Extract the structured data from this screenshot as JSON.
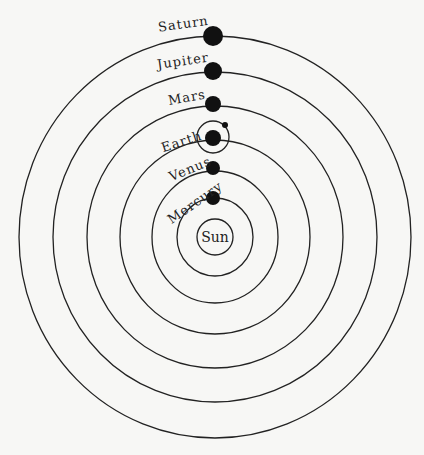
{
  "diagram": {
    "type": "heliocentric-model",
    "center": {
      "x": 215,
      "y": 237
    },
    "sun": {
      "label": "Sun",
      "r": 18
    },
    "orbits": [
      {
        "name": "Mercury",
        "rx": 38,
        "ry": 39
      },
      {
        "name": "Venus",
        "rx": 63,
        "ry": 66
      },
      {
        "name": "Earth",
        "rx": 95,
        "ry": 97
      },
      {
        "name": "Mars",
        "rx": 128,
        "ry": 131
      },
      {
        "name": "Jupiter",
        "rx": 162,
        "ry": 165
      },
      {
        "name": "Saturn",
        "rx": 196,
        "ry": 201
      }
    ],
    "planets": [
      {
        "label": "Saturn",
        "x": 213,
        "y": 36,
        "r": 10
      },
      {
        "label": "Jupiter",
        "x": 213,
        "y": 71,
        "r": 9
      },
      {
        "label": "Mars",
        "x": 213,
        "y": 104,
        "r": 8
      },
      {
        "label": "Earth",
        "x": 213,
        "y": 138,
        "r": 8
      },
      {
        "label": "Venus",
        "x": 213,
        "y": 168,
        "r": 7
      },
      {
        "label": "Mercury",
        "x": 213,
        "y": 198,
        "r": 7
      }
    ],
    "moon": {
      "orbit_cx": 213,
      "orbit_cy": 137,
      "orbit_r": 16,
      "x": 225,
      "y": 125,
      "r": 3
    },
    "colors": {
      "ink": "#111111",
      "background": "#f7f7f5"
    }
  }
}
